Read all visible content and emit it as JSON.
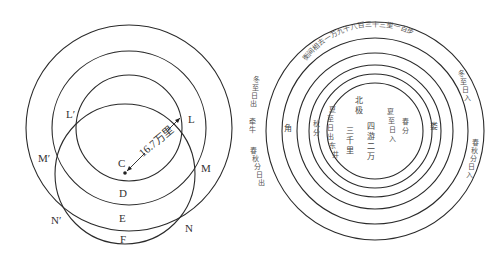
{
  "left_diagram": {
    "points": {
      "L_prime": "L′",
      "L": "L",
      "M_prime": "M′",
      "M": "M",
      "C": "C",
      "D": "D",
      "N_prime": "N′",
      "E": "E",
      "N": "N",
      "F": "F"
    },
    "radius_label": "16.7万里"
  },
  "right_diagram": {
    "ring_caption": "衡间相去一万九千八百三十三里一百步",
    "center": {
      "beiji": [
        "北",
        "极"
      ],
      "sanqianli": [
        "三",
        "千",
        "里"
      ],
      "siyouerwan": [
        "四",
        "游",
        "二",
        "万"
      ]
    },
    "inner_left": {
      "xiazhi_richu": [
        "夏",
        "至",
        "日",
        "出",
        "东",
        "井"
      ],
      "qiufen": [
        "秋",
        "分"
      ]
    },
    "inner_right": {
      "xiazhi_riru": [
        "夏",
        "至",
        "日",
        "入"
      ],
      "chunfen": [
        "春",
        "分"
      ]
    },
    "ring_left": "角",
    "ring_right": "娄",
    "outside_left": {
      "dongzhi_richu": [
        "冬",
        "至",
        "日",
        "出"
      ],
      "qianniu": [
        "牵",
        "牛"
      ],
      "chunqiufen_richu": [
        "春",
        "秋",
        "分",
        "日",
        "出"
      ]
    },
    "outside_right": {
      "dongzhi_riru": [
        "冬",
        "至",
        "日",
        "入"
      ],
      "chunqiufen_riru": [
        "春",
        "秋",
        "分",
        "日",
        "入"
      ]
    }
  }
}
